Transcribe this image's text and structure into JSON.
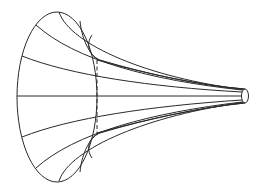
{
  "figure": {
    "description": "Line drawing of a horn-shaped surface of revolution (tractricoid / Gabriel's horn) with meridian curves converging to a narrow tube",
    "stroke_color": "#2a2a2a",
    "background_color": "#ffffff",
    "mouth": {
      "cx": 57,
      "cy": 97,
      "rx": 40,
      "ry": 85
    },
    "tip": {
      "cx": 245,
      "cy": 96,
      "rx": 3.5,
      "ry": 7
    },
    "dashed_section_x": 97
  }
}
